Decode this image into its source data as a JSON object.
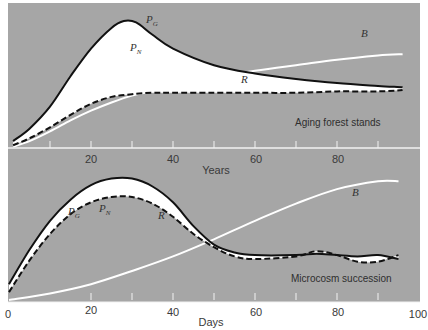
{
  "colors": {
    "panel_bg": "#a6a6a6",
    "fill_between": "#ffffff",
    "pg_line": "#111111",
    "r_line": "#111111",
    "b_line": "#ffffff",
    "axis_line": "#f2f2f2",
    "text": "#333333"
  },
  "chart_data": [
    {
      "type": "line",
      "title": "Aging forest stands",
      "xlabel": "Years",
      "ylabel": "",
      "xlim": [
        0,
        100
      ],
      "xticks_labeled": [
        20,
        40,
        60,
        80
      ],
      "xticks_minor": [
        10,
        30,
        50,
        70,
        90
      ],
      "grid": false,
      "legend": "inline labels",
      "y_units": "relative (0 = axis, 1 = top of panel)",
      "series": [
        {
          "name": "P_G",
          "label_main": "P",
          "label_sub": "G",
          "style": "solid-black",
          "x": [
            1,
            5,
            10,
            15,
            20,
            25,
            28,
            31,
            35,
            40,
            50,
            60,
            70,
            80,
            90,
            96
          ],
          "y": [
            0.05,
            0.14,
            0.3,
            0.52,
            0.72,
            0.87,
            0.92,
            0.91,
            0.82,
            0.72,
            0.6,
            0.54,
            0.5,
            0.47,
            0.45,
            0.44
          ]
        },
        {
          "name": "R",
          "label_main": "R",
          "label_sub": "",
          "style": "dashed-black",
          "x": [
            1,
            5,
            10,
            15,
            20,
            25,
            30,
            35,
            40,
            50,
            60,
            70,
            80,
            90,
            96
          ],
          "y": [
            0.02,
            0.07,
            0.15,
            0.24,
            0.32,
            0.37,
            0.39,
            0.4,
            0.4,
            0.4,
            0.4,
            0.4,
            0.41,
            0.41,
            0.42
          ]
        },
        {
          "name": "B",
          "label_main": "B",
          "label_sub": "",
          "style": "solid-white",
          "x": [
            1,
            5,
            10,
            15,
            20,
            25,
            30,
            35,
            40,
            50,
            60,
            70,
            80,
            90,
            96
          ],
          "y": [
            0.01,
            0.05,
            0.12,
            0.2,
            0.27,
            0.33,
            0.38,
            0.41,
            0.45,
            0.51,
            0.56,
            0.6,
            0.64,
            0.67,
            0.68
          ]
        }
      ],
      "annotations": [
        {
          "text": "P_N",
          "note": "white area between P_G and R"
        }
      ]
    },
    {
      "type": "line",
      "title": "Microcosm succession",
      "xlabel": "Days",
      "ylabel": "",
      "xlim": [
        0,
        100
      ],
      "xticks_labeled": [
        0,
        20,
        40,
        60,
        80,
        100
      ],
      "xticks_minor": [
        30,
        50,
        70,
        90
      ],
      "grid": false,
      "legend": "inline labels",
      "y_units": "relative (0 = axis, 1 = top of panel)",
      "series": [
        {
          "name": "P_G",
          "label_main": "P",
          "label_sub": "G",
          "style": "solid-black",
          "x": [
            0,
            5,
            10,
            15,
            20,
            25,
            30,
            35,
            40,
            45,
            50,
            55,
            60,
            70,
            75,
            80,
            85,
            90,
            95
          ],
          "y": [
            0.12,
            0.38,
            0.6,
            0.76,
            0.87,
            0.92,
            0.92,
            0.86,
            0.74,
            0.56,
            0.42,
            0.36,
            0.34,
            0.34,
            0.35,
            0.34,
            0.33,
            0.34,
            0.31
          ]
        },
        {
          "name": "R",
          "label_main": "R",
          "label_sub": "",
          "style": "dashed-black",
          "x": [
            0,
            5,
            10,
            15,
            20,
            25,
            30,
            35,
            40,
            45,
            50,
            55,
            60,
            70,
            75,
            80,
            85,
            90,
            95
          ],
          "y": [
            0.06,
            0.3,
            0.5,
            0.65,
            0.74,
            0.78,
            0.78,
            0.73,
            0.63,
            0.5,
            0.4,
            0.33,
            0.31,
            0.33,
            0.37,
            0.34,
            0.29,
            0.29,
            0.34
          ]
        },
        {
          "name": "B",
          "label_main": "B",
          "label_sub": "",
          "style": "solid-white",
          "x": [
            0,
            10,
            20,
            30,
            40,
            50,
            60,
            70,
            80,
            90,
            95
          ],
          "y": [
            0.0,
            0.05,
            0.12,
            0.22,
            0.33,
            0.46,
            0.6,
            0.73,
            0.84,
            0.9,
            0.9
          ]
        }
      ],
      "annotations": [
        {
          "text": "P_N",
          "note": "white area between P_G and R"
        }
      ]
    }
  ],
  "top_panel": {
    "title": "Aging forest stands",
    "xlabel": "Years",
    "tick_labels": [
      "20",
      "40",
      "60",
      "80"
    ],
    "labels": {
      "pg": "P",
      "pg_sub": "G",
      "pn": "P",
      "pn_sub": "N",
      "r": "R",
      "b": "B"
    }
  },
  "bottom_panel": {
    "title": "Microcosm succession",
    "xlabel": "Days",
    "tick_labels": [
      "0",
      "20",
      "40",
      "60",
      "80",
      "100"
    ],
    "labels": {
      "pg": "P",
      "pg_sub": "G",
      "pn": "P",
      "pn_sub": "N",
      "r": "R",
      "b": "B"
    }
  }
}
